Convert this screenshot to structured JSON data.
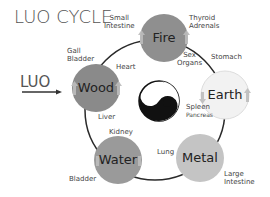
{
  "title": "LUO CYCLE",
  "entry_label": "LUO",
  "elements": [
    {
      "name": "Fire",
      "color": "#8f8f8f"
    },
    {
      "name": "Earth",
      "color": "#f2f2f2"
    },
    {
      "name": "Metal",
      "color": "#c4c4c4"
    },
    {
      "name": "Water",
      "color": "#9a9a9a"
    },
    {
      "name": "Wood",
      "color": "#8a8a8a"
    }
  ],
  "organs": {
    "small_intestine": "Small\nIntestine",
    "thyroid_adrenals": "Thyroid\nAdrenals",
    "sex_organs": "Sex\nOrgans",
    "heart": "Heart",
    "stomach": "Stomach",
    "gall_bladder": "Gall\nBladder",
    "liver": "Liver",
    "spleen": "Spleen",
    "pancreas": "Pancreas",
    "kidney": "Kidney",
    "lung": "Lung",
    "bladder": "Bladder",
    "large_intestine": "Large\nIntestine"
  },
  "center_symbol": "yin-yang"
}
